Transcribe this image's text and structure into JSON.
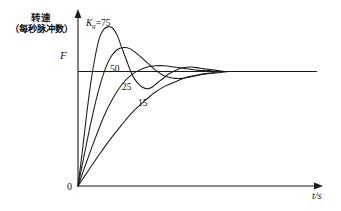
{
  "chart_data": {
    "type": "line",
    "title": "",
    "subtitle": "",
    "ylabel_line1": "转速",
    "ylabel_line2": "（每秒脉冲数）",
    "ylabel_symbol": "F",
    "xlabel": "t/s",
    "origin_label": "0",
    "grid": false,
    "legend_position": "inline-curve-labels",
    "axis_arrows": true,
    "xlim": [
      0,
      10
    ],
    "ylim": [
      0,
      1.45
    ],
    "steady_state_value": 1.0,
    "annotations": [
      {
        "name": "gain-75",
        "text": "K₉=75",
        "symbol": "K",
        "subscript": "g",
        "value": 75,
        "x": 0.55,
        "y": 1.38
      },
      {
        "name": "gain-50",
        "text": "50",
        "value": 50,
        "x": 1.6,
        "y": 0.8
      },
      {
        "name": "gain-25",
        "text": "25",
        "value": 25,
        "x": 2.1,
        "y": 0.62
      },
      {
        "name": "gain-15",
        "text": "15",
        "value": 15,
        "x": 2.75,
        "y": 0.44
      }
    ],
    "series": [
      {
        "name": "Kg=75",
        "label": "K₉=75",
        "gain": 75,
        "overshoot_pct": 38,
        "peak_time": 1.45,
        "settling_time": 6.2,
        "x": [
          0.0,
          0.18,
          0.36,
          0.55,
          0.73,
          0.91,
          1.09,
          1.27,
          1.45,
          1.64,
          1.82,
          2.0,
          2.18,
          2.36,
          2.55,
          2.73,
          2.91,
          3.09,
          3.27,
          3.45,
          3.64,
          3.82,
          4.0,
          4.36,
          4.73,
          5.09,
          5.45,
          5.82,
          6.18,
          6.55,
          7.0,
          8.0,
          9.0,
          10.0
        ],
        "y": [
          0.0,
          0.3,
          0.62,
          0.92,
          1.14,
          1.3,
          1.37,
          1.39,
          1.38,
          1.32,
          1.22,
          1.12,
          1.02,
          0.94,
          0.89,
          0.86,
          0.85,
          0.86,
          0.89,
          0.92,
          0.95,
          0.98,
          1.0,
          1.03,
          1.04,
          1.03,
          1.02,
          1.01,
          1.0,
          1.0,
          1.0,
          1.0,
          1.0,
          1.0
        ]
      },
      {
        "name": "50",
        "label": "50",
        "gain": 50,
        "overshoot_pct": 20,
        "peak_time": 2.0,
        "settling_time": 6.6,
        "x": [
          0.0,
          0.27,
          0.55,
          0.82,
          1.09,
          1.36,
          1.64,
          1.91,
          2.18,
          2.45,
          2.73,
          3.0,
          3.27,
          3.55,
          3.82,
          4.09,
          4.36,
          4.64,
          4.91,
          5.27,
          5.64,
          6.0,
          6.55,
          7.09,
          8.0,
          9.0,
          10.0
        ],
        "y": [
          0.0,
          0.28,
          0.56,
          0.8,
          0.99,
          1.12,
          1.19,
          1.21,
          1.2,
          1.16,
          1.11,
          1.06,
          1.01,
          0.97,
          0.95,
          0.94,
          0.94,
          0.95,
          0.96,
          0.98,
          0.99,
          1.0,
          1.0,
          1.0,
          1.0,
          1.0,
          1.0
        ]
      },
      {
        "name": "25",
        "label": "25",
        "gain": 25,
        "overshoot_pct": 5,
        "peak_time": 3.1,
        "settling_time": 6.9,
        "x": [
          0.0,
          0.36,
          0.73,
          1.09,
          1.45,
          1.82,
          2.18,
          2.55,
          2.91,
          3.27,
          3.64,
          4.0,
          4.36,
          4.73,
          5.09,
          5.45,
          5.82,
          6.18,
          6.55,
          7.09,
          8.0,
          9.0,
          10.0
        ],
        "y": [
          0.0,
          0.21,
          0.42,
          0.61,
          0.76,
          0.88,
          0.96,
          1.01,
          1.04,
          1.05,
          1.05,
          1.04,
          1.03,
          1.02,
          1.01,
          1.01,
          1.0,
          1.0,
          1.0,
          1.0,
          1.0,
          1.0,
          1.0
        ]
      },
      {
        "name": "15",
        "label": "15",
        "gain": 15,
        "overshoot_pct": 0,
        "peak_time": null,
        "settling_time": 7.6,
        "x": [
          0.0,
          0.45,
          0.91,
          1.36,
          1.82,
          2.27,
          2.73,
          3.18,
          3.64,
          4.09,
          4.55,
          5.0,
          5.45,
          5.91,
          6.36,
          6.82,
          7.27,
          7.73,
          8.18,
          9.0,
          10.0
        ],
        "y": [
          0.0,
          0.14,
          0.28,
          0.41,
          0.53,
          0.64,
          0.73,
          0.81,
          0.87,
          0.91,
          0.95,
          0.97,
          0.98,
          0.99,
          1.0,
          1.0,
          1.0,
          1.0,
          1.0,
          1.0,
          1.0
        ]
      }
    ],
    "colors": {
      "stroke": "#1a1a1a",
      "background": "#ffffff"
    }
  }
}
